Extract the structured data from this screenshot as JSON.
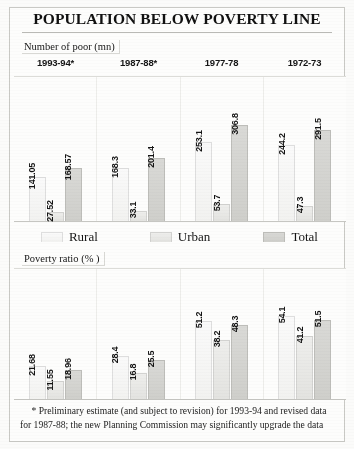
{
  "title": "POPULATION BELOW POVERTY LINE",
  "sections": {
    "top_caption": "Number of poor (mn)",
    "bottom_caption": "Poverty ratio (% )"
  },
  "years": [
    "1993-94*",
    "1987-88*",
    "1977-78",
    "1972-73"
  ],
  "legend": [
    {
      "label": "Rural",
      "swatch": "rural-swatch",
      "color": "#f6f6f4"
    },
    {
      "label": "Urban",
      "swatch": "urban-swatch",
      "color": "#e8e8e5"
    },
    {
      "label": "Total",
      "swatch": "total-swatch",
      "color": "#d4d4d1"
    }
  ],
  "footnote": {
    "line1": "* Preliminary estimate (and subject to revision) for 1993-94 and revised data",
    "line2": "for 1987-88; the new Planning Commission may significantly upgrade the data"
  },
  "chart_data": [
    {
      "type": "bar",
      "title": "Number of poor (mn)",
      "xlabel": "",
      "ylabel": "Number of poor (mn)",
      "categories": [
        "1993-94*",
        "1987-88*",
        "1977-78",
        "1972-73"
      ],
      "ylim": [
        0,
        320
      ],
      "grid": false,
      "legend_position": "below",
      "series": [
        {
          "name": "Rural",
          "values": [
            141.05,
            168.3,
            253.1,
            244.2
          ]
        },
        {
          "name": "Urban",
          "values": [
            27.52,
            33.1,
            53.7,
            47.3
          ]
        },
        {
          "name": "Total",
          "values": [
            168.57,
            201.4,
            306.8,
            291.5
          ]
        }
      ],
      "labels": [
        [
          "141.05",
          "27.52",
          "168.57"
        ],
        [
          "168.3",
          "33.1",
          "201.4"
        ],
        [
          "253.1",
          "53.7",
          "306.8"
        ],
        [
          "244.2",
          "47.3",
          "291.5"
        ]
      ]
    },
    {
      "type": "bar",
      "title": "Poverty ratio (% )",
      "xlabel": "",
      "ylabel": "Poverty ratio (%)",
      "categories": [
        "1993-94*",
        "1987-88*",
        "1977-78",
        "1972-73"
      ],
      "ylim": [
        0,
        60
      ],
      "grid": false,
      "legend_position": "above",
      "series": [
        {
          "name": "Rural",
          "values": [
            21.68,
            28.4,
            51.2,
            54.1
          ]
        },
        {
          "name": "Urban",
          "values": [
            11.55,
            16.8,
            38.2,
            41.2
          ]
        },
        {
          "name": "Total",
          "values": [
            18.96,
            25.5,
            48.3,
            51.5
          ]
        }
      ],
      "labels": [
        [
          "21.68",
          "11.55",
          "18.96"
        ],
        [
          "28.4",
          "16.8",
          "25.5"
        ],
        [
          "51.2",
          "38.2",
          "48.3"
        ],
        [
          "54.1",
          "41.2",
          "51.5"
        ]
      ]
    }
  ]
}
